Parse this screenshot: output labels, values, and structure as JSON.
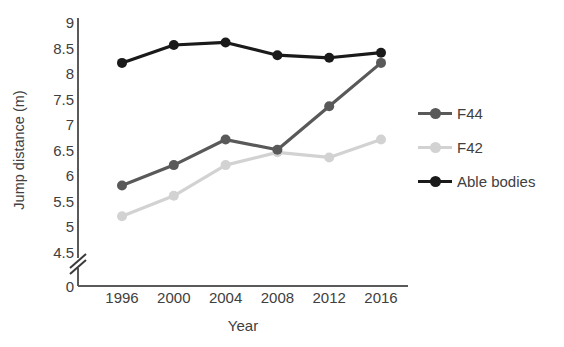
{
  "chart_data": {
    "type": "line",
    "title": "",
    "xlabel": "Year",
    "ylabel": "Jump distance (m)",
    "categories": [
      "1996",
      "2000",
      "2004",
      "2008",
      "2012",
      "2016"
    ],
    "x": [
      1996,
      2000,
      2004,
      2008,
      2012,
      2016
    ],
    "ylim": [
      4.5,
      9
    ],
    "yticks": [
      "0",
      "4.5",
      "5",
      "5.5",
      "6",
      "6.5",
      "7",
      "7.5",
      "8",
      "8.5",
      "9"
    ],
    "ytick_values": [
      0,
      4.5,
      5,
      5.5,
      6,
      6.5,
      7,
      7.5,
      8,
      8.5,
      9
    ],
    "axis_break": true,
    "grid": false,
    "legend_position": "right",
    "series": [
      {
        "name": "F44",
        "color": "#595959",
        "values": [
          5.8,
          6.2,
          6.7,
          6.5,
          7.35,
          8.2
        ]
      },
      {
        "name": "F42",
        "color": "#d2d2d2",
        "values": [
          5.2,
          5.6,
          6.2,
          6.45,
          6.35,
          6.7
        ]
      },
      {
        "name": "Able bodies",
        "color": "#1a1a1a",
        "values": [
          8.2,
          8.55,
          8.6,
          8.35,
          8.3,
          8.4
        ]
      }
    ]
  },
  "legend": {
    "items": [
      {
        "label": "F44"
      },
      {
        "label": "F42"
      },
      {
        "label": "Able bodies"
      }
    ]
  },
  "axes": {
    "y_title": "Jump distance (m)",
    "x_title": "Year"
  }
}
